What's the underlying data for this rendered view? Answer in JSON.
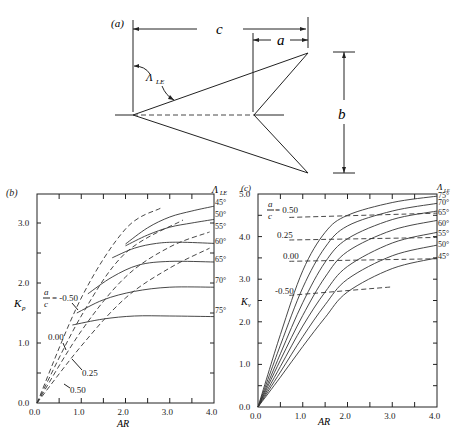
{
  "figure": {
    "panel_a": {
      "label": "(a)",
      "dim_c": "c",
      "dim_a": "a",
      "dim_b": "b",
      "sweep_label": "Λ",
      "sweep_sub": "LE"
    },
    "panel_b": {
      "label": "(b)",
      "ylabel": "K",
      "ylabel_sub": "p",
      "xlabel": "AR",
      "right_header": "Λ",
      "right_header_sub": "LE",
      "ac_label_num": "a",
      "ac_label_den": "c",
      "ac_first": "= -0.50",
      "ac_others": [
        "0.00",
        "0.25",
        "0.50"
      ]
    },
    "panel_c": {
      "label": "(c)",
      "ylabel": "K",
      "ylabel_sub": "v",
      "xlabel": "AR",
      "right_header": "Λ",
      "right_header_sub": "LE",
      "ac_label_num": "a",
      "ac_label_den": "c",
      "ac_first": "= 0.50",
      "ac_others": [
        "0.25",
        "0.00",
        "-0.50"
      ]
    }
  },
  "chart_data": [
    {
      "type": "line",
      "title": "(b) Potential-flow lift constant K_p vs aspect ratio",
      "xlabel": "AR",
      "ylabel": "K_p",
      "xlim": [
        0,
        4
      ],
      "ylim": [
        0,
        3.5
      ],
      "xticks": [
        "0.0",
        "1.0",
        "2.0",
        "3.0",
        "4.0"
      ],
      "yticks": [
        "0.0",
        "1.0",
        "2.0",
        "3.0"
      ],
      "grid": false,
      "legend_position": "right (sweep angles Λ_LE)",
      "series_sweep": [
        {
          "name": "45°",
          "x": [
            2.0,
            2.5,
            3.0,
            3.5,
            4.0
          ],
          "y": [
            2.65,
            2.92,
            3.1,
            3.2,
            3.28
          ]
        },
        {
          "name": "50°",
          "x": [
            2.0,
            2.5,
            3.0,
            3.5,
            4.0
          ],
          "y": [
            2.62,
            2.8,
            2.93,
            3.0,
            3.06
          ]
        },
        {
          "name": "55°",
          "x": [
            1.7,
            2.2,
            2.7,
            3.2,
            4.0
          ],
          "y": [
            2.42,
            2.58,
            2.66,
            2.68,
            2.66
          ]
        },
        {
          "name": "60°",
          "x": [
            1.15,
            1.7,
            2.3,
            3.0,
            4.0
          ],
          "y": [
            1.82,
            2.1,
            2.3,
            2.36,
            2.35
          ]
        },
        {
          "name": "65°",
          "x": [
            0.9,
            1.5,
            2.2,
            3.0,
            4.0
          ],
          "y": [
            1.5,
            1.72,
            1.86,
            1.93,
            1.93
          ]
        },
        {
          "name": "70°/75°",
          "x": [
            0.8,
            1.5,
            2.2,
            3.0,
            4.0
          ],
          "y": [
            1.3,
            1.4,
            1.45,
            1.45,
            1.44
          ]
        }
      ],
      "series_ac": [
        {
          "name": "a/c = -0.50",
          "x": [
            0,
            1.0,
            2.0,
            2.8
          ],
          "y": [
            0,
            1.75,
            2.9,
            3.25
          ]
        },
        {
          "name": "a/c = 0.00",
          "x": [
            0,
            1.0,
            2.0,
            3.3
          ],
          "y": [
            0,
            1.45,
            2.5,
            3.05
          ]
        },
        {
          "name": "a/c = 0.25",
          "x": [
            0,
            1.0,
            2.0,
            3.0,
            3.9
          ],
          "y": [
            0,
            1.2,
            2.1,
            2.6,
            2.85
          ]
        },
        {
          "name": "a/c = 0.50",
          "x": [
            0,
            1.0,
            2.0,
            3.0,
            3.9
          ],
          "y": [
            0,
            0.95,
            1.75,
            2.25,
            2.58
          ]
        }
      ],
      "right_tick_labels": [
        "45°",
        "50°",
        "55°",
        "60°",
        "65°",
        "70°",
        "75°"
      ]
    },
    {
      "type": "line",
      "title": "(c) Vortex lift constant K_v vs aspect ratio",
      "xlabel": "AR",
      "ylabel": "K_v",
      "xlim": [
        0,
        4
      ],
      "ylim": [
        0,
        5
      ],
      "xticks": [
        "0.0",
        "1.0",
        "2.0",
        "3.0",
        "4.0"
      ],
      "yticks": [
        "0.0",
        "1.0",
        "2.0",
        "3.0",
        "4.0",
        "5.0"
      ],
      "grid": false,
      "legend_position": "right (sweep angles Λ_LE)",
      "series_sweep": [
        {
          "name": "75°",
          "x": [
            0,
            0.5,
            1.0,
            1.5,
            2.0,
            3.0,
            4.0
          ],
          "y": [
            0,
            1.7,
            3.2,
            4.1,
            4.5,
            4.8,
            4.95
          ]
        },
        {
          "name": "70°",
          "x": [
            0,
            0.5,
            1.0,
            1.5,
            2.0,
            3.0,
            4.0
          ],
          "y": [
            0,
            1.45,
            2.8,
            3.75,
            4.25,
            4.6,
            4.78
          ]
        },
        {
          "name": "65°",
          "x": [
            0,
            0.5,
            1.0,
            1.5,
            2.0,
            3.0,
            4.0
          ],
          "y": [
            0,
            1.25,
            2.45,
            3.4,
            3.95,
            4.4,
            4.6
          ]
        },
        {
          "name": "60°",
          "x": [
            0,
            0.5,
            1.0,
            1.5,
            2.0,
            3.0,
            4.0
          ],
          "y": [
            0,
            1.1,
            2.15,
            3.05,
            3.65,
            4.15,
            4.38
          ]
        },
        {
          "name": "55°",
          "x": [
            0,
            0.5,
            1.0,
            1.5,
            2.0,
            3.0,
            4.0
          ],
          "y": [
            0,
            0.95,
            1.9,
            2.7,
            3.3,
            3.85,
            4.1
          ]
        },
        {
          "name": "50°",
          "x": [
            0,
            0.5,
            1.0,
            1.5,
            2.0,
            3.0,
            4.0
          ],
          "y": [
            0,
            0.82,
            1.65,
            2.4,
            3.0,
            3.55,
            3.8
          ]
        },
        {
          "name": "45°",
          "x": [
            0,
            0.5,
            1.0,
            1.5,
            2.0,
            3.0,
            4.0
          ],
          "y": [
            0,
            0.7,
            1.42,
            2.1,
            2.7,
            3.25,
            3.5
          ]
        }
      ],
      "series_ac": [
        {
          "name": "a/c = 0.50",
          "x": [
            0.7,
            4.0
          ],
          "y": [
            4.45,
            4.55
          ]
        },
        {
          "name": "a/c = 0.25",
          "x": [
            0.7,
            4.0
          ],
          "y": [
            3.92,
            3.98
          ]
        },
        {
          "name": "a/c = 0.00",
          "x": [
            0.7,
            4.0
          ],
          "y": [
            3.42,
            3.48
          ]
        },
        {
          "name": "a/c = -0.50",
          "x": [
            0.7,
            3.0
          ],
          "y": [
            2.62,
            2.82
          ]
        }
      ],
      "right_tick_labels": [
        "75°",
        "70°",
        "65°",
        "60°",
        "55°",
        "50°",
        "45°"
      ]
    }
  ]
}
